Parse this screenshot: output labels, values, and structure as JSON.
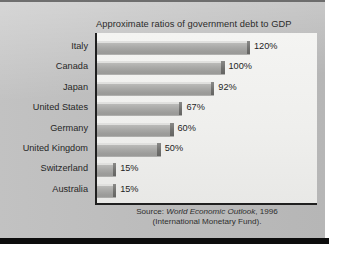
{
  "chart_data": {
    "type": "bar",
    "orientation": "horizontal",
    "title": "Approximate ratios of government debt to GDP",
    "xlabel": "",
    "ylabel": "",
    "xlim": [
      0,
      120
    ],
    "grid": false,
    "legend": null,
    "unit": "%",
    "categories": [
      "Italy",
      "Canada",
      "Japan",
      "United States",
      "Germany",
      "United Kingdom",
      "Switzerland",
      "Australia"
    ],
    "values": [
      120,
      100,
      92,
      67,
      60,
      50,
      15,
      15
    ],
    "value_labels": [
      "120%",
      "100%",
      "92%",
      "67%",
      "60%",
      "50%",
      "15%",
      "15%"
    ],
    "bars": [
      {
        "category": "Italy",
        "value": 120,
        "label": "120%"
      },
      {
        "category": "Canada",
        "value": 100,
        "label": "100%"
      },
      {
        "category": "Japan",
        "value": 92,
        "label": "92%"
      },
      {
        "category": "United States",
        "value": 67,
        "label": "67%"
      },
      {
        "category": "Germany",
        "value": 60,
        "label": "60%"
      },
      {
        "category": "United Kingdom",
        "value": 50,
        "label": "50%"
      },
      {
        "category": "Switzerland",
        "value": 15,
        "label": "15%"
      },
      {
        "category": "Australia",
        "value": 15,
        "label": "15%"
      }
    ]
  },
  "source": {
    "prefix": "Source: ",
    "publication": "World Economic Outlook",
    "year": ", 1996",
    "organization": "(International Monetary Fund)."
  },
  "colors": {
    "page_background": "#bcbcbc",
    "plot_background": "#f1f1ef",
    "bar_fill": "#a8a8a6",
    "bar_cap": "#6f6f6d",
    "axis": "#1f1f1f",
    "text": "#262626",
    "bottom_bar": "#0d0d0d"
  }
}
